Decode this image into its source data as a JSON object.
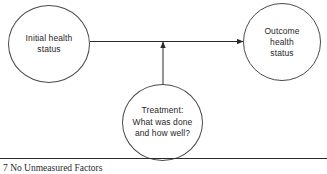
{
  "figure": {
    "caption": "7 No Unmeasured Factors",
    "background_color": "#ffffff",
    "stroke_color": "#4a4a4a",
    "text_color": "#1f1f1f"
  },
  "nodes": {
    "initial": {
      "id": "initial-health-status",
      "label": "Initial health\nstatus"
    },
    "outcome": {
      "id": "outcome-health-status",
      "label": "Outcome\nhealth\nstatus"
    },
    "treatment": {
      "id": "treatment",
      "label": "Treatment:\nWhat was done\nand how well?"
    }
  },
  "edges": [
    {
      "id": "initial-to-outcome",
      "from": "initial-health-status",
      "to": "outcome-health-status",
      "style": "solid",
      "arrowhead": "filled-triangle",
      "direction": "right"
    },
    {
      "id": "treatment-to-edge",
      "from": "treatment",
      "to": "initial-to-outcome",
      "style": "solid",
      "arrowhead": "filled-triangle",
      "direction": "up"
    }
  ]
}
